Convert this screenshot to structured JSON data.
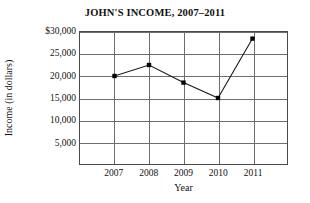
{
  "chart_data": {
    "type": "line",
    "title": "JOHN'S INCOME, 2007–2011",
    "xlabel": "Year",
    "ylabel": "Income (in dollars)",
    "categories": [
      "2007",
      "2008",
      "2009",
      "2010",
      "2011"
    ],
    "values": [
      20000,
      22500,
      18500,
      15000,
      28500
    ],
    "series": [
      {
        "name": "Income",
        "values": [
          20000,
          22500,
          18500,
          15000,
          28500
        ]
      }
    ],
    "ylim": [
      0,
      30000
    ],
    "ytick_values": [
      5000,
      10000,
      15000,
      20000,
      25000,
      30000
    ],
    "ytick_labels": [
      "5,000",
      "10,000",
      "15,000",
      "20,000",
      "25,000",
      "$30,000"
    ],
    "xtick_labels": [
      "2007",
      "2008",
      "2009",
      "2010",
      "2011"
    ],
    "grid": "both",
    "legend": "none",
    "line_color": "#1a1a1a",
    "marker_color": "#000000",
    "marker_shape": "square",
    "grid_color": "#6e6e6e",
    "axis_color": "#4a4a4a",
    "background_color": "#ffffff"
  }
}
